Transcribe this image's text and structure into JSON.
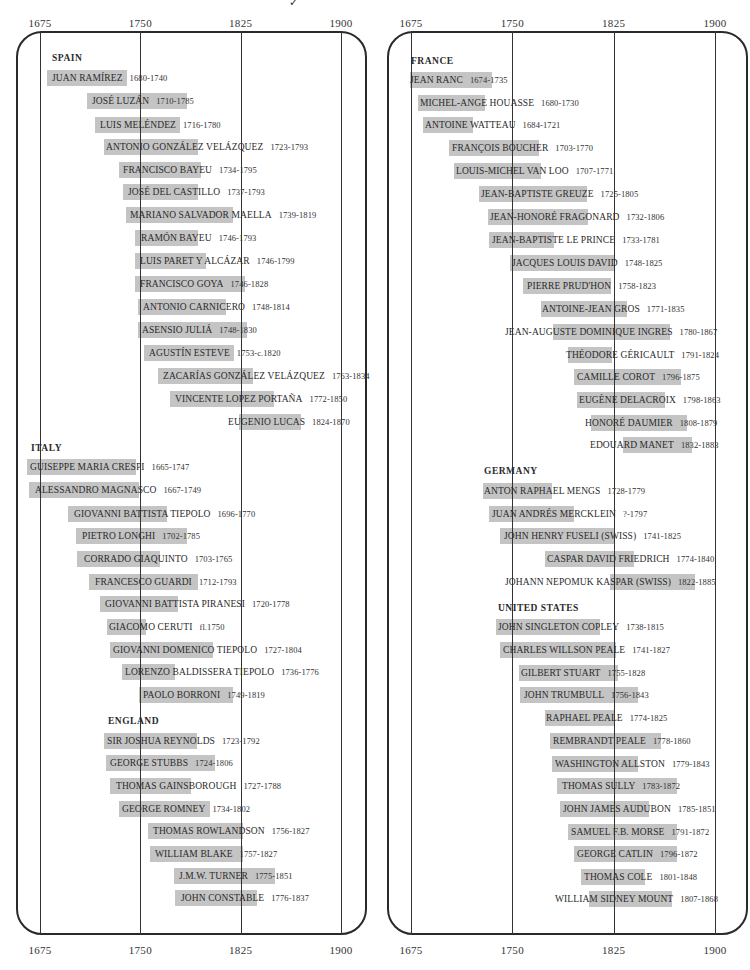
{
  "chart_data": {
    "type": "timeline",
    "title": "",
    "xlabel": "Year",
    "x_ticks": [
      1675,
      1750,
      1825,
      1900
    ],
    "xlim": [
      1675,
      1900
    ],
    "grid": true,
    "panels": [
      {
        "id": "left",
        "groups": [
          {
            "name": "SPAIN",
            "artists": [
              {
                "name": "JUAN RAMÍREZ",
                "dates": "1680-1740",
                "start": 1680,
                "end": 1740
              },
              {
                "name": "JOSÉ LUZÁN",
                "dates": "1710-1785",
                "start": 1710,
                "end": 1785
              },
              {
                "name": "LUIS MELÉNDEZ",
                "dates": "1716-1780",
                "start": 1716,
                "end": 1780
              },
              {
                "name": "ANTONIO GONZÁLEZ VELÁZQUEZ",
                "dates": "1723-1793",
                "start": 1723,
                "end": 1793
              },
              {
                "name": "FRANCISCO BAYEU",
                "dates": "1734-1795",
                "start": 1734,
                "end": 1795
              },
              {
                "name": "JOSÉ DEL CASTILLO",
                "dates": "1737-1793",
                "start": 1737,
                "end": 1793
              },
              {
                "name": "MARIANO SALVADOR MAELLA",
                "dates": "1739-1819",
                "start": 1739,
                "end": 1819
              },
              {
                "name": "RAMÓN BAYEU",
                "dates": "1746-1793",
                "start": 1746,
                "end": 1793
              },
              {
                "name": "LUIS PARET Y ALCÁZAR",
                "dates": "1746-1799",
                "start": 1746,
                "end": 1799
              },
              {
                "name": "FRANCISCO GOYA",
                "dates": "1746-1828",
                "start": 1746,
                "end": 1828
              },
              {
                "name": "ANTONIO CARNICERO",
                "dates": "1748-1814",
                "start": 1748,
                "end": 1814
              },
              {
                "name": "ASENSIO JULIÁ",
                "dates": "1748-1830",
                "start": 1748,
                "end": 1830
              },
              {
                "name": "AGUSTÍN ESTEVE",
                "dates": "1753-c.1820",
                "start": 1753,
                "end": 1820
              },
              {
                "name": "ZACARÍAS GONZÁLEZ VELÁZQUEZ",
                "dates": "1763-1834",
                "start": 1763,
                "end": 1834
              },
              {
                "name": "VINCENTE LOPEZ PORTAÑA",
                "dates": "1772-1850",
                "start": 1772,
                "end": 1850
              },
              {
                "name": "EUGENIO LUCAS",
                "dates": "1824-1870",
                "start": 1824,
                "end": 1870
              }
            ]
          },
          {
            "name": "ITALY",
            "artists": [
              {
                "name": "GUISEPPE MARIA CRESPI",
                "dates": "1665-1747",
                "start": 1665,
                "end": 1747
              },
              {
                "name": "ALESSANDRO MAGNASCO",
                "dates": "1667-1749",
                "start": 1667,
                "end": 1749
              },
              {
                "name": "GIOVANNI BATTISTA TIEPOLO",
                "dates": "1696-1770",
                "start": 1696,
                "end": 1770
              },
              {
                "name": "PIETRO LONGHI",
                "dates": "1702-1785",
                "start": 1702,
                "end": 1785
              },
              {
                "name": "CORRADO GIAQUINTO",
                "dates": "1703-1765",
                "start": 1703,
                "end": 1765
              },
              {
                "name": "FRANCESCO GUARDI",
                "dates": "1712-1793",
                "start": 1712,
                "end": 1793
              },
              {
                "name": "GIOVANNI BATTISTA PIRANESI",
                "dates": "1720-1778",
                "start": 1720,
                "end": 1778
              },
              {
                "name": "GIACOMO CERUTI",
                "dates": "fl.1750",
                "start": 1725,
                "end": 1754
              },
              {
                "name": "GIOVANNI DOMENICO TIEPOLO",
                "dates": "1727-1804",
                "start": 1727,
                "end": 1804
              },
              {
                "name": "LORENZO BALDISSERA TIEPOLO",
                "dates": "1736-1776",
                "start": 1736,
                "end": 1776
              },
              {
                "name": "PAOLO BORRONI",
                "dates": "1749-1819",
                "start": 1749,
                "end": 1819
              }
            ]
          },
          {
            "name": "ENGLAND",
            "artists": [
              {
                "name": "SIR JOSHUA REYNOLDS",
                "dates": "1723-1792",
                "start": 1723,
                "end": 1792
              },
              {
                "name": "GEORGE STUBBS",
                "dates": "1724-1806",
                "start": 1724,
                "end": 1806
              },
              {
                "name": "THOMAS GAINSBOROUGH",
                "dates": "1727-1788",
                "start": 1727,
                "end": 1788
              },
              {
                "name": "GEORGE ROMNEY",
                "dates": "1734-1802",
                "start": 1734,
                "end": 1802
              },
              {
                "name": "THOMAS ROWLANDSON",
                "dates": "1756-1827",
                "start": 1756,
                "end": 1827
              },
              {
                "name": "WILLIAM BLAKE",
                "dates": "1757-1827",
                "start": 1757,
                "end": 1827
              },
              {
                "name": "J.M.W. TURNER",
                "dates": "1775-1851",
                "start": 1775,
                "end": 1851
              },
              {
                "name": "JOHN CONSTABLE",
                "dates": "1776-1837",
                "start": 1776,
                "end": 1837
              }
            ]
          }
        ]
      },
      {
        "id": "right",
        "groups": [
          {
            "name": "FRANCE",
            "artists": [
              {
                "name": "JEAN RANC",
                "dates": "1674-1735",
                "start": 1674,
                "end": 1735
              },
              {
                "name": "MICHEL-ANGE HOUASSE",
                "dates": "1680-1730",
                "start": 1680,
                "end": 1730
              },
              {
                "name": "ANTOINE WATTEAU",
                "dates": "1684-1721",
                "start": 1684,
                "end": 1721
              },
              {
                "name": "FRANÇOIS BOUCHER",
                "dates": "1703-1770",
                "start": 1703,
                "end": 1770
              },
              {
                "name": "LOUIS-MICHEL VAN LOO",
                "dates": "1707-1771",
                "start": 1707,
                "end": 1771
              },
              {
                "name": "JEAN-BAPTISTE GREUZE",
                "dates": "1725-1805",
                "start": 1725,
                "end": 1805
              },
              {
                "name": "JEAN-HONORÉ FRAGONARD",
                "dates": "1732-1806",
                "start": 1732,
                "end": 1806
              },
              {
                "name": "JEAN-BAPTISTE LE PRINCE",
                "dates": "1733-1781",
                "start": 1733,
                "end": 1781
              },
              {
                "name": "JACQUES LOUIS DAVID",
                "dates": "1748-1825",
                "start": 1748,
                "end": 1825
              },
              {
                "name": "PIERRE PRUD'HON",
                "dates": "1758-1823",
                "start": 1758,
                "end": 1823
              },
              {
                "name": "ANTOINE-JEAN GROS",
                "dates": "1771-1835",
                "start": 1771,
                "end": 1835
              },
              {
                "name": "JEAN-AUGUSTE DOMINIQUE INGRES",
                "dates": "1780-1867",
                "start": 1780,
                "end": 1867
              },
              {
                "name": "THÉODORE GÉRICAULT",
                "dates": "1791-1824",
                "start": 1791,
                "end": 1824
              },
              {
                "name": "CAMILLE COROT",
                "dates": "1796-1875",
                "start": 1796,
                "end": 1875
              },
              {
                "name": "EUGÈNE DELACROIX",
                "dates": "1798-1863",
                "start": 1798,
                "end": 1863
              },
              {
                "name": "HONORÉ DAUMIER",
                "dates": "1808-1879",
                "start": 1808,
                "end": 1879
              },
              {
                "name": "EDOUARD MANET",
                "dates": "1832-1883",
                "start": 1832,
                "end": 1883
              }
            ]
          },
          {
            "name": "GERMANY",
            "artists": [
              {
                "name": "ANTON RAPHAEL MENGS",
                "dates": "1728-1779",
                "start": 1728,
                "end": 1779
              },
              {
                "name": "JUAN ANDRÉS MERCKLEIN",
                "dates": "?-1797",
                "start": 1733,
                "end": 1796
              },
              {
                "name": "JOHN HENRY FUSELI (SWISS)",
                "dates": "1741-1825",
                "start": 1741,
                "end": 1825
              },
              {
                "name": "CASPAR DAVID FRIEDRICH",
                "dates": "1774-1840",
                "start": 1774,
                "end": 1840
              },
              {
                "name": "JOHANN NEPOMUK KASPAR (SWISS)",
                "dates": "1822-1885",
                "start": 1822,
                "end": 1885
              }
            ]
          },
          {
            "name": "UNITED STATES",
            "artists": [
              {
                "name": "JOHN SINGLETON COPLEY",
                "dates": "1738-1815",
                "start": 1738,
                "end": 1815
              },
              {
                "name": "CHARLES WILLSON PEALE",
                "dates": "1741-1827",
                "start": 1741,
                "end": 1827
              },
              {
                "name": "GILBERT STUART",
                "dates": "1755-1828",
                "start": 1755,
                "end": 1828
              },
              {
                "name": "JOHN TRUMBULL",
                "dates": "1756-1843",
                "start": 1756,
                "end": 1843
              },
              {
                "name": "RAPHAEL PEALE",
                "dates": "1774-1825",
                "start": 1774,
                "end": 1825
              },
              {
                "name": "REMBRANDT PEALE",
                "dates": "1778-1860",
                "start": 1778,
                "end": 1860
              },
              {
                "name": "WASHINGTON ALLSTON",
                "dates": "1779-1843",
                "start": 1779,
                "end": 1843
              },
              {
                "name": "THOMAS SULLY",
                "dates": "1783-1872",
                "start": 1783,
                "end": 1872
              },
              {
                "name": "JOHN JAMES AUDUBON",
                "dates": "1785-1851",
                "start": 1785,
                "end": 1851
              },
              {
                "name": "SAMUEL F.B. MORSE",
                "dates": "1791-1872",
                "start": 1791,
                "end": 1872
              },
              {
                "name": "GEORGE CATLIN",
                "dates": "1796-1872",
                "start": 1796,
                "end": 1872
              },
              {
                "name": "THOMAS COLE",
                "dates": "1801-1848",
                "start": 1801,
                "end": 1848
              },
              {
                "name": "WILLIAM SIDNEY MOUNT",
                "dates": "1807-1868",
                "start": 1807,
                "end": 1868
              }
            ]
          }
        ]
      }
    ]
  },
  "axis": {
    "ticks": [
      "1675",
      "1750",
      "1825",
      "1900"
    ]
  },
  "colors": {
    "bar": "#c4c4c4",
    "line": "#2a2a2a"
  },
  "top_mark": "✓"
}
